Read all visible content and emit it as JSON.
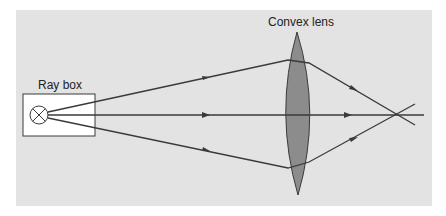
{
  "diagram": {
    "type": "optics-ray-diagram",
    "labels": {
      "ray_box": "Ray box",
      "lens": "Convex lens"
    },
    "colors": {
      "background": "#ffffff",
      "panel": "#e3e3e3",
      "ray": "#3a3a3a",
      "lens_fill": "#8c8c8c",
      "lens_stroke": "#3a3a3a",
      "box_fill": "#ffffff"
    },
    "elements": {
      "ray_box": {
        "x": 23,
        "y": 94,
        "width": 72,
        "height": 42
      },
      "bulb": {
        "cx": 39,
        "cy": 115,
        "r": 9
      },
      "lens": {
        "cx": 298,
        "top": 32,
        "bottom": 195,
        "half_width": 12
      },
      "focal_point": {
        "x": 399,
        "y": 114
      }
    },
    "rays": [
      {
        "name": "upper-ray",
        "points": [
          [
            48,
            112
          ],
          [
            288,
            60
          ],
          [
            309,
            63
          ],
          [
            415,
            125
          ]
        ]
      },
      {
        "name": "axis-ray",
        "points": [
          [
            48,
            115
          ],
          [
            424,
            115
          ]
        ]
      },
      {
        "name": "lower-ray",
        "points": [
          [
            48,
            118
          ],
          [
            288,
            168
          ],
          [
            309,
            162
          ],
          [
            415,
            104
          ]
        ]
      }
    ]
  }
}
